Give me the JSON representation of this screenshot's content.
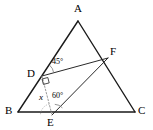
{
  "figure": {
    "type": "geometry-diagram",
    "background_color": "#ffffff",
    "stroke_color": "#1a1a1a",
    "dash_color": "#9a9a9a",
    "points": [
      {
        "id": "A",
        "label": "A",
        "x": 78,
        "y": 21,
        "label_x": 74,
        "label_y": 3
      },
      {
        "id": "B",
        "label": "B",
        "x": 18,
        "y": 112,
        "label_x": 5,
        "label_y": 105
      },
      {
        "id": "C",
        "label": "C",
        "x": 135,
        "y": 112,
        "label_x": 138,
        "label_y": 105
      },
      {
        "id": "D",
        "label": "D",
        "x": 42,
        "y": 76,
        "label_x": 27,
        "label_y": 68
      },
      {
        "id": "E",
        "label": "E",
        "x": 52,
        "y": 115,
        "label_x": 47,
        "label_y": 117
      },
      {
        "id": "F",
        "label": "F",
        "x": 108,
        "y": 58,
        "label_x": 110,
        "label_y": 46
      }
    ],
    "segments": [
      {
        "name": "side-AB",
        "from": "A",
        "to": "B",
        "style": "solid"
      },
      {
        "name": "side-AC",
        "from": "A",
        "to": "C",
        "style": "solid"
      },
      {
        "name": "side-BC",
        "from": "B",
        "to": "C",
        "style": "solid"
      },
      {
        "name": "segment-DF",
        "from": "D",
        "to": "F",
        "style": "solid"
      },
      {
        "name": "segment-EF",
        "from": "E",
        "to": "F",
        "style": "solid"
      },
      {
        "name": "segment-DE",
        "from": "D",
        "to": "E",
        "style": "dashed"
      }
    ],
    "angle_marks": [
      {
        "name": "angle-45-at-D",
        "label": "45°",
        "vertex": "D",
        "label_x": 52,
        "label_y": 58
      },
      {
        "name": "angle-60-at-E",
        "label": "60°",
        "vertex": "E",
        "label_x": 52,
        "label_y": 92
      },
      {
        "name": "angle-x-at-E",
        "label": "x",
        "vertex": "E",
        "label_x": 39,
        "label_y": 93
      },
      {
        "name": "right-angle-at-D",
        "label": "",
        "vertex": "D",
        "label_x": 0,
        "label_y": 0
      }
    ]
  }
}
